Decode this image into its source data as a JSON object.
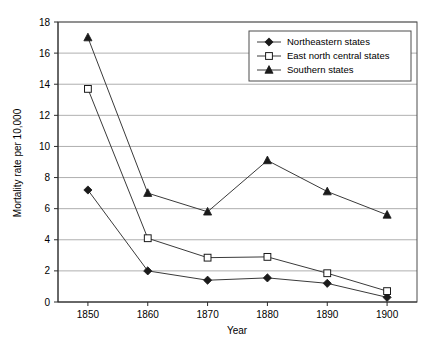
{
  "chart_data": {
    "type": "line",
    "title": "",
    "xlabel": "Year",
    "ylabel": "Mortality rate per 10,000",
    "x": [
      1850,
      1860,
      1870,
      1880,
      1890,
      1900
    ],
    "xtick_labels": [
      "1850",
      "1860",
      "1870",
      "1880",
      "1890",
      "1900"
    ],
    "ytick_labels": [
      "0",
      "2",
      "4",
      "6",
      "8",
      "10",
      "12",
      "14",
      "16",
      "18"
    ],
    "ylim": [
      0,
      18
    ],
    "ytick_step": 2,
    "xlim": [
      1845,
      1905
    ],
    "grid": "horizontal",
    "legend_position": "top-right",
    "series": [
      {
        "name": "Northeastern states",
        "marker": "filled-diamond",
        "values": [
          7.2,
          2.0,
          1.4,
          1.55,
          1.2,
          0.3
        ]
      },
      {
        "name": "East north central states",
        "marker": "open-square",
        "values": [
          13.7,
          4.1,
          2.85,
          2.9,
          1.85,
          0.7
        ]
      },
      {
        "name": "Southern states",
        "marker": "filled-triangle",
        "values": [
          17.0,
          7.0,
          5.8,
          9.1,
          7.1,
          5.6
        ]
      }
    ],
    "colors": {
      "line": "#3a3a3a",
      "marker_fill": "#1a1a1a",
      "marker_open_fill": "#ffffff",
      "grid": "#9a9a9a",
      "frame": "#4d4d4d",
      "background": "#ffffff"
    }
  }
}
